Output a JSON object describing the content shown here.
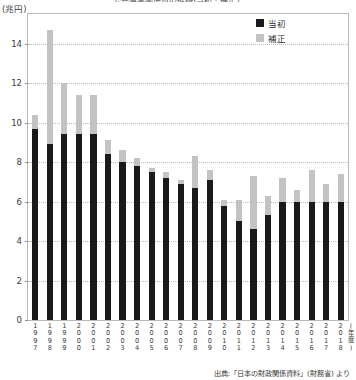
{
  "chart_data": {
    "type": "bar",
    "title": "公共事業関係費の推移(当初・補正)",
    "subtitle": "",
    "ylabel": "(兆円)",
    "xlabel": "(年度)",
    "ylim": [
      0,
      15.5
    ],
    "yticks": [
      0,
      2,
      4,
      6,
      8,
      10,
      12,
      14
    ],
    "ytick_labels": [
      "0",
      "2",
      "4",
      "6",
      "8",
      "10",
      "12",
      "14"
    ],
    "grid": true,
    "legend_position": "top-right",
    "categories": [
      "1997",
      "1998",
      "1999",
      "2000",
      "2001",
      "2002",
      "2003",
      "2004",
      "2005",
      "2006",
      "2007",
      "2008",
      "2009",
      "2010",
      "2011",
      "2012",
      "2013",
      "2014",
      "2015",
      "2016",
      "2017",
      "2018"
    ],
    "series": [
      {
        "name": "当初",
        "color": "#1a1a1a",
        "values": [
          9.7,
          8.9,
          9.4,
          9.4,
          9.4,
          8.4,
          8.0,
          7.8,
          7.5,
          7.2,
          6.9,
          6.7,
          7.1,
          5.8,
          5.0,
          4.6,
          5.3,
          6.0,
          6.0,
          6.0,
          6.0,
          6.0
        ]
      },
      {
        "name": "補正",
        "color": "#c3c3c3",
        "values": [
          0.7,
          5.8,
          2.6,
          2.0,
          2.0,
          0.7,
          0.6,
          0.4,
          0.2,
          0.3,
          0.2,
          1.6,
          0.5,
          0.3,
          1.1,
          2.7,
          1.0,
          1.2,
          0.6,
          1.6,
          0.9,
          1.4
        ]
      }
    ],
    "series_totals": [
      10.4,
      14.7,
      12.0,
      11.4,
      11.4,
      9.1,
      8.6,
      8.2,
      7.7,
      7.5,
      7.1,
      8.3,
      7.6,
      6.1,
      6.1,
      7.3,
      6.3,
      7.2,
      6.6,
      7.6,
      6.9,
      7.4
    ]
  },
  "legend": {
    "items": [
      {
        "label": "当初",
        "swatch": "dark-square-icon"
      },
      {
        "label": "補正",
        "swatch": "light-square-icon"
      }
    ]
  },
  "axis": {
    "unit_label": "(兆円)",
    "x_unit_label": "(年度)"
  },
  "source": {
    "text": "出典:「日本の財政関係資料」(財務省) より"
  }
}
